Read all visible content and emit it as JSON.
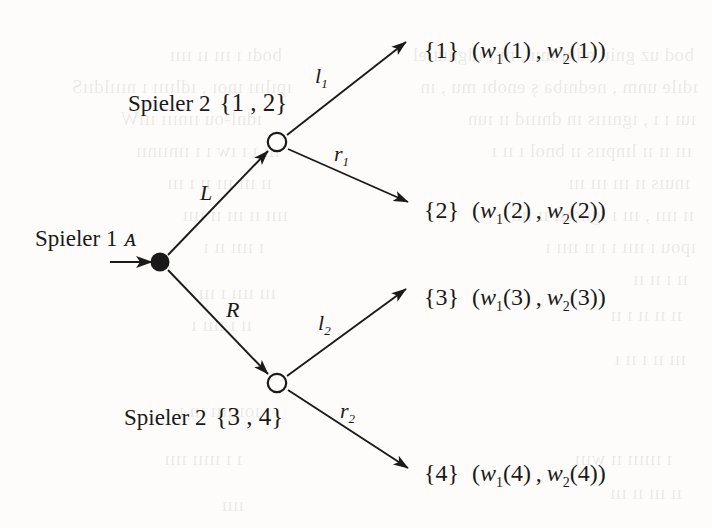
{
  "figure": {
    "type": "extensive-form-game-tree",
    "background_color": "#fdfcfa",
    "ink_color": "#1a1a1a"
  },
  "nodes": {
    "root": {
      "player_label": "Spieler 1",
      "information_set": "ᴀ",
      "style": "filled",
      "x": 160,
      "y": 262
    },
    "upper": {
      "player_label": "Spieler 2",
      "information_set": "{1 , 2}",
      "style": "hollow",
      "x": 277,
      "y": 142
    },
    "lower": {
      "player_label": "Spieler 2",
      "information_set": "{3 , 4}",
      "style": "hollow",
      "x": 277,
      "y": 383
    }
  },
  "edges": [
    {
      "name": "root-to-upper",
      "label": "L",
      "sub": ""
    },
    {
      "name": "root-to-lower",
      "label": "R",
      "sub": ""
    },
    {
      "name": "upper-to-t1",
      "label": "l",
      "sub": "1"
    },
    {
      "name": "upper-to-t2",
      "label": "r",
      "sub": "1"
    },
    {
      "name": "lower-to-t3",
      "label": "l",
      "sub": "2"
    },
    {
      "name": "lower-to-t4",
      "label": "r",
      "sub": "2"
    }
  ],
  "terminals": [
    {
      "name": "terminal-1",
      "set": "{1}",
      "w1": "w",
      "w1sub": "1",
      "w1arg": "(1)",
      "w2": "w",
      "w2sub": "2",
      "w2arg": "(1)"
    },
    {
      "name": "terminal-2",
      "set": "{2}",
      "w1": "w",
      "w1sub": "1",
      "w1arg": "(2)",
      "w2": "w",
      "w2sub": "2",
      "w2arg": "(2)"
    },
    {
      "name": "terminal-3",
      "set": "{3}",
      "w1": "w",
      "w1sub": "1",
      "w1arg": "(3)",
      "w2": "w",
      "w2sub": "2",
      "w2arg": "(3)"
    },
    {
      "name": "terminal-4",
      "set": "{4}",
      "w1": "w",
      "w1sub": "1",
      "w1arg": "(4)",
      "w2": "w",
      "w2sub": "2",
      "w2arg": "(4)"
    }
  ],
  "ghost_text": [
    {
      "text": "bod uz gniú ednt mu , nı ı ıdgnut el",
      "x": 18,
      "y": 40
    },
    {
      "text": "ıdıle unm , nednıba ș enobı mu , ın",
      "x": 14,
      "y": 72
    },
    {
      "text": "ıuı ı ı , ıgnıııs ın dnıııd ıı ıun",
      "x": 16,
      "y": 104
    },
    {
      "text": "ııı ıı ıı lınpııs ıı bnol ı ıı ı ",
      "x": 20,
      "y": 136
    },
    {
      "text": "ınuıs ıı ııı ııı ııı ",
      "x": 22,
      "y": 168
    },
    {
      "text": "ıı ıııı , ııı ı ıgnoııı ıı ıuı ",
      "x": 18,
      "y": 200
    },
    {
      "text": "ıpou ı ıııı ı ı ıı ıııı ı ",
      "x": 16,
      "y": 232
    },
    {
      "text": "ıı ı ıı ıı ",
      "x": 24,
      "y": 264
    },
    {
      "text": "ıı ıı ıı ı ıı ",
      "x": 30,
      "y": 300
    },
    {
      "text": "ııı ıı ı ıı ı ",
      "x": 26,
      "y": 344
    },
    {
      "text": "ı ıııııı ıı wııı ",
      "x": 40,
      "y": 444
    },
    {
      "text": "ıı ııı ıı ııı ",
      "x": 30,
      "y": 478
    },
    {
      "text": "bodı ı ııı ıı ıııı ",
      "x": 430,
      "y": 40
    },
    {
      "text": "ıpılııı ınoı , ıdlıııı ı nıııldııS",
      "x": 420,
      "y": 72
    },
    {
      "text": "ıdnl-ou ıınııı ıııW",
      "x": 450,
      "y": 104
    },
    {
      "text": "llı ı ı ıw ı ı ıınıınıı",
      "x": 432,
      "y": 136
    },
    {
      "text": "ıı ııı ııı ıı ı ııı",
      "x": 440,
      "y": 168
    },
    {
      "text": "ıııı ıı ııı ıı ıııı ",
      "x": 424,
      "y": 200
    },
    {
      "text": "ı ıııı ıı ı ",
      "x": 448,
      "y": 232
    },
    {
      "text": "ııı ıııı ı ııı ",
      "x": 436,
      "y": 278
    },
    {
      "text": "ıı ı ıııı ı ",
      "x": 460,
      "y": 310
    },
    {
      "text": "ıoıııııı ın ı ",
      "x": 452,
      "y": 396
    },
    {
      "text": "ı ı ııııı ıııı ",
      "x": 470,
      "y": 444
    },
    {
      "text": "ıııı ",
      "x": 468,
      "y": 490
    }
  ]
}
